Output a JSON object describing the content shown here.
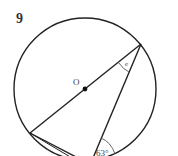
{
  "problem_number": "9",
  "diagram": {
    "center_label": "O",
    "unknown_angle_label": "e",
    "known_angle_label": "63°",
    "circle": {
      "cx": 85,
      "cy": 89,
      "r": 71
    },
    "points": {
      "top_right": [
        141,
        44
      ],
      "left": [
        30,
        133
      ],
      "bottom": [
        93,
        158
      ],
      "center": [
        85,
        89
      ]
    },
    "stroke_color": "#222222"
  }
}
